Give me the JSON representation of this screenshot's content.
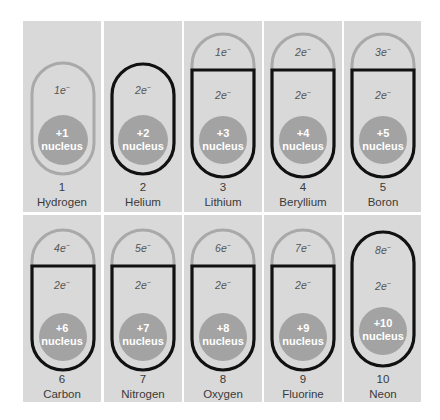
{
  "diagram": {
    "title": "",
    "colors": {
      "panel_bg": "#d9d9d9",
      "inner_shell": "#111111",
      "outer_shell": "#a9a9a9",
      "nucleus": "#a3a3a3",
      "nucleus_text": "#ffffff",
      "label_text": "#3a3a3a"
    },
    "elements": [
      {
        "atomic_number": "1",
        "name": "Hydrogen",
        "nucleus_charge": "+1",
        "nucleus_label": "nucleus",
        "shell1": "1e",
        "shell2": null,
        "shell1_style": "gray-open"
      },
      {
        "atomic_number": "2",
        "name": "Helium",
        "nucleus_charge": "+2",
        "nucleus_label": "nucleus",
        "shell1": "2e",
        "shell2": null,
        "shell1_style": "black-full"
      },
      {
        "atomic_number": "3",
        "name": "Lithium",
        "nucleus_charge": "+3",
        "nucleus_label": "nucleus",
        "shell1": "2e",
        "shell2": "1e",
        "shell2_style": "gray-open"
      },
      {
        "atomic_number": "4",
        "name": "Beryllium",
        "nucleus_charge": "+4",
        "nucleus_label": "nucleus",
        "shell1": "2e",
        "shell2": "2e",
        "shell2_style": "gray-open"
      },
      {
        "atomic_number": "5",
        "name": "Boron",
        "nucleus_charge": "+5",
        "nucleus_label": "nucleus",
        "shell1": "2e",
        "shell2": "3e",
        "shell2_style": "gray-open"
      },
      {
        "atomic_number": "6",
        "name": "Carbon",
        "nucleus_charge": "+6",
        "nucleus_label": "nucleus",
        "shell1": "2e",
        "shell2": "4e",
        "shell2_style": "gray-open"
      },
      {
        "atomic_number": "7",
        "name": "Nitrogen",
        "nucleus_charge": "+7",
        "nucleus_label": "nucleus",
        "shell1": "2e",
        "shell2": "5e",
        "shell2_style": "gray-open"
      },
      {
        "atomic_number": "8",
        "name": "Oxygen",
        "nucleus_charge": "+8",
        "nucleus_label": "nucleus",
        "shell1": "2e",
        "shell2": "6e",
        "shell2_style": "gray-open"
      },
      {
        "atomic_number": "9",
        "name": "Fluorine",
        "nucleus_charge": "+9",
        "nucleus_label": "nucleus",
        "shell1": "2e",
        "shell2": "7e",
        "shell2_style": "gray-open"
      },
      {
        "atomic_number": "10",
        "name": "Neon",
        "nucleus_charge": "+10",
        "nucleus_label": "nucleus",
        "shell1": "2e",
        "shell2": "8e",
        "shell2_style": "black-full"
      }
    ],
    "electron_superscript": "−"
  }
}
